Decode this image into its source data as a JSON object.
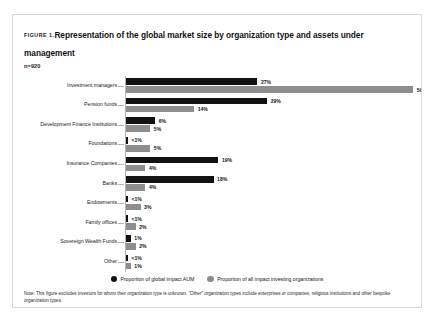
{
  "figure": {
    "label": "Figure 1.",
    "title": "Representation of the global market size by organization type and assets under management",
    "sample_size": "n=920"
  },
  "legend": {
    "series1_label": "Proportion of global impact AUM",
    "series2_label": "Proportion of all impact investing organizations"
  },
  "footnotes": {
    "note": "Note: This figure excludes investors for whom their organization type is unknown. “Other” organization types include enterprises or companies, religious institutions and other bespoke organization types.",
    "source": "Source: Global Impact Investing Network (GIIN), 2024"
  },
  "colors": {
    "series1": "#121212",
    "series2": "#8e8e8e",
    "axis": "#b4b4b4",
    "card_border": "#d8d8d8"
  },
  "chart_data": {
    "type": "bar",
    "orientation": "horizontal",
    "title": "Representation of the global market size by organization type and assets under management",
    "subtitle": "n=920",
    "xlabel": "",
    "ylabel": "",
    "xlim": [
      0,
      60
    ],
    "grid": false,
    "legend_position": "bottom-center",
    "categories": [
      "Investment managers",
      "Pension funds",
      "Development Finance Institutions",
      "Foundations",
      "Insurance Companies",
      "Banks",
      "Endowments",
      "Family offices",
      "Sovereign Wealth Funds",
      "Other"
    ],
    "series": [
      {
        "name": "Proportion of global impact AUM",
        "color": "#121212",
        "values": [
          27,
          29,
          6,
          0.4,
          19,
          18,
          0.4,
          0.4,
          1,
          0.4
        ],
        "labels": [
          "27%",
          "29%",
          "6%",
          "<1%",
          "19%",
          "18%",
          "<1%",
          "<1%",
          "1%",
          "<1%"
        ]
      },
      {
        "name": "Proportion of all impact investing organizations",
        "color": "#8e8e8e",
        "values": [
          59,
          14,
          5,
          5,
          4,
          4,
          3,
          2,
          2,
          1
        ],
        "labels": [
          "59%",
          "14%",
          "5%",
          "5%",
          "4%",
          "4%",
          "3%",
          "2%",
          "2%",
          "1%"
        ]
      }
    ]
  }
}
